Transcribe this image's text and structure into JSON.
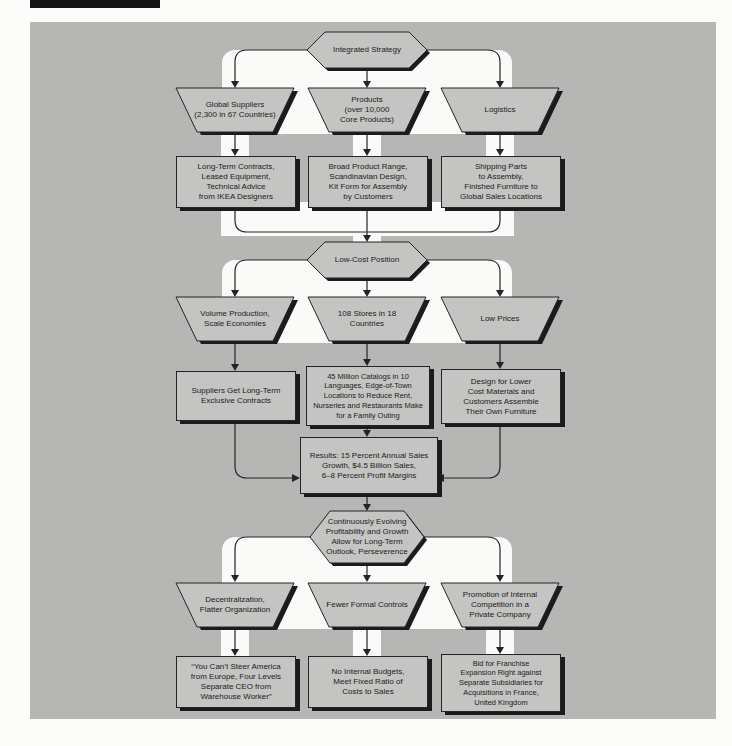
{
  "colors": {
    "panel": "#b6b6b4",
    "node_fill": "#c4c4c2",
    "ribbon": "#fafaf8",
    "line": "#242424",
    "shadow": "#1b1b1b",
    "top_bar": "#161616"
  },
  "flow": {
    "s1": {
      "hex": "Integrated Strategy",
      "traps": [
        "Global Suppliers\n(2,300 in 67 Countries)",
        "Products\n(over 10,000\nCore Products)",
        "Logistics"
      ],
      "boxes": [
        "Long-Term Contracts,\nLeased Equipment,\nTechnical Advice\nfrom IKEA Designers",
        "Broad Product Range,\nScandinavian Design,\nKit Form for Assembly\nby Customers",
        "Shipping Parts\nto Assembly,\nFinished Furniture to\nGlobal Sales Locations"
      ]
    },
    "s2": {
      "hex": "Low-Cost Position",
      "traps": [
        "Volume Production,\nScale Economies",
        "108 Stores in 18\nCountries",
        "Low Prices"
      ],
      "boxes": [
        "Suppliers Get Long-Term\nExclusive Contracts",
        "45 Million Catalogs in 10\nLanguages, Edge-of-Town\nLocations to Reduce Rent,\nNurseries and Restaurants Make\nfor a Family Outing",
        "Design for Lower\nCost Materials and\nCustomers Assemble\nTheir Own Furniture"
      ],
      "results": "Results: 15 Percent Annual Sales\nGrowth, $4.5 Billion Sales,\n6–8 Percent Profit Margins"
    },
    "s3": {
      "hex": "Continuously Evolving\nProfitability and Growth\nAllow for Long-Term\nOutlook, Perseverence",
      "traps": [
        "Decentralization,\nFlatter Organization",
        "Fewer Formal Controls",
        "Promotion of Internal\nCompetition in a\nPrivate Company"
      ],
      "boxes": [
        "“You Can’t Steer America\nfrom Europe, Four Levels\nSeparate CEO from\nWarehouse Worker”",
        "No Internal Budgets,\nMeet Fixed Ratio of\nCosts to Sales",
        "Bid for Franchise\nExpansion Right against\nSeparate Subsidiaries for\nAcquisitions in France,\nUnited Kingdom"
      ]
    }
  }
}
